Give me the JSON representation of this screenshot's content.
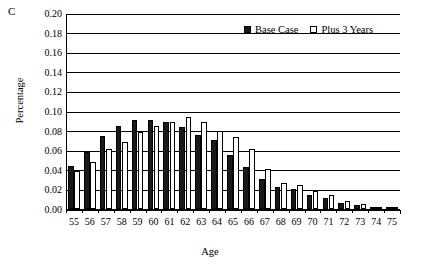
{
  "panel": {
    "label": "C"
  },
  "legend": {
    "position": "top-right",
    "entries": [
      {
        "label": "Base Case",
        "swatch": "filled-square",
        "color": "#1a1a1a"
      },
      {
        "label": "Plus 3 Years",
        "swatch": "open-square",
        "color": "#ffffff"
      }
    ]
  },
  "axes": {
    "ylabel": "Percentage",
    "xlabel": "Age",
    "yticks": [
      "0.00",
      "0.02",
      "0.04",
      "0.06",
      "0.08",
      "0.10",
      "0.12",
      "0.14",
      "0.16",
      "0.18",
      "0.20"
    ],
    "xticks": [
      "55",
      "56",
      "57",
      "58",
      "59",
      "60",
      "61",
      "62",
      "63",
      "64",
      "65",
      "66",
      "67",
      "68",
      "69",
      "70",
      "71",
      "72",
      "73",
      "74",
      "75"
    ]
  },
  "chart_data": {
    "type": "bar",
    "title": "C",
    "xlabel": "Age",
    "ylabel": "Percentage",
    "ylim": [
      0.0,
      0.2
    ],
    "grid": true,
    "legend_position": "top-right",
    "categories": [
      "55",
      "56",
      "57",
      "58",
      "59",
      "60",
      "61",
      "62",
      "63",
      "64",
      "65",
      "66",
      "67",
      "68",
      "69",
      "70",
      "71",
      "72",
      "73",
      "74",
      "75"
    ],
    "series": [
      {
        "name": "Base Case",
        "color": "#1a1a1a",
        "values": [
          0.044,
          0.058,
          0.074,
          0.085,
          0.091,
          0.091,
          0.089,
          0.084,
          0.076,
          0.07,
          0.055,
          0.043,
          0.031,
          0.022,
          0.02,
          0.014,
          0.011,
          0.006,
          0.004,
          0.002,
          0.001
        ]
      },
      {
        "name": "Plus 3 Years",
        "color": "#ffffff",
        "values": [
          0.039,
          0.048,
          0.061,
          0.068,
          0.079,
          0.085,
          0.089,
          0.094,
          0.089,
          0.08,
          0.073,
          0.061,
          0.041,
          0.027,
          0.024,
          0.018,
          0.014,
          0.008,
          0.005,
          0.002,
          0.001
        ]
      }
    ]
  }
}
